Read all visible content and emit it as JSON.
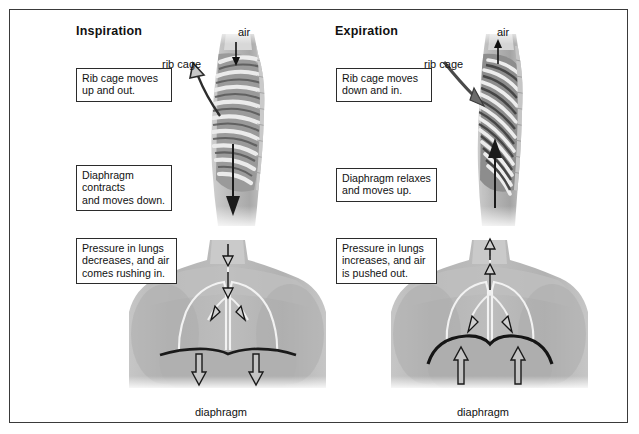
{
  "figure": {
    "title_left": "Inspiration",
    "title_right": "Expiration",
    "frame_color": "#3a3a3a",
    "background": "#ffffff"
  },
  "left_column": {
    "heading": "Inspiration",
    "labels": {
      "air": "air",
      "rib_cage": "rib cage",
      "diaphragm": "diaphragm"
    },
    "boxes": [
      {
        "name": "rib-cage-box",
        "lines": [
          "Rib cage moves",
          "up and out."
        ]
      },
      {
        "name": "diaphragm-box",
        "lines": [
          "Diaphragm",
          "contracts",
          "and moves down."
        ]
      },
      {
        "name": "pressure-box",
        "lines": [
          "Pressure in lungs",
          "decreases, and air",
          "comes rushing in."
        ]
      }
    ]
  },
  "right_column": {
    "heading": "Expiration",
    "labels": {
      "air": "air",
      "rib_cage": "rib cage",
      "diaphragm": "diaphragm"
    },
    "boxes": [
      {
        "name": "rib-cage-box",
        "lines": [
          "Rib cage moves",
          "down and in."
        ]
      },
      {
        "name": "diaphragm-box",
        "lines": [
          "Diaphragm relaxes",
          "and moves up."
        ]
      },
      {
        "name": "pressure-box",
        "lines": [
          "Pressure in lungs",
          "increases, and air",
          "is pushed out."
        ]
      }
    ]
  },
  "colors": {
    "ink": "#111111",
    "box_border": "#2b2b2b",
    "skin_light": "#d2d2d2",
    "skin_mid": "#b4b4b4",
    "skin_dark": "#8f8f8f",
    "rib_light": "#e2e2e2",
    "rib_gap": "#5a5a5a",
    "lung_outline": "#f4f4f4",
    "diaphragm_line": "#1d1d1d"
  }
}
